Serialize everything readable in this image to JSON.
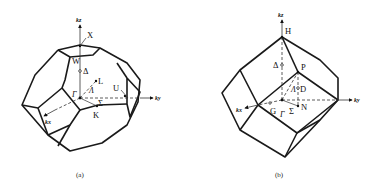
{
  "figures": [
    {
      "id": "a",
      "caption": "(a)",
      "description": "Brillouin zone of face-centered cubic lattice (truncated octahedron)",
      "axes": {
        "kz": "kz",
        "ky": "ky",
        "kx": "kx"
      },
      "points": {
        "X": "X",
        "W": "W",
        "Delta": "Δ",
        "L": "L",
        "Lambda": "Λ",
        "Gamma": "Γ",
        "U": "U",
        "Sigma": "Σ",
        "K": "K"
      }
    },
    {
      "id": "b",
      "caption": "(b)",
      "description": "Brillouin zone of body-centered cubic lattice (rhombic dodecahedron)",
      "axes": {
        "kz": "kz",
        "ky": "ky",
        "kx": "kx"
      },
      "points": {
        "H": "H",
        "Delta": "Δ",
        "P": "P",
        "Lambda": "Λ",
        "D": "D",
        "N": "N",
        "G": "G",
        "Gamma": "Γ",
        "Sigma": "Σ"
      }
    }
  ]
}
